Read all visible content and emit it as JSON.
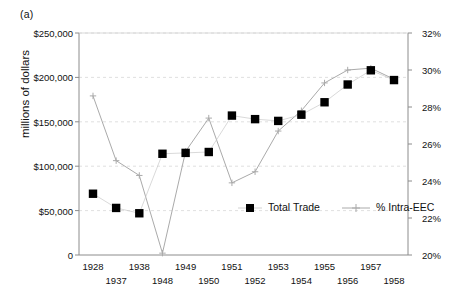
{
  "panel": {
    "label": "(a)"
  },
  "chart_data": {
    "type": "line",
    "title": "",
    "xlabel": "",
    "ylabel": "millions of dollars",
    "y2label": "",
    "grid": true,
    "legend_position": "inside-bottom",
    "x": [
      "1928",
      "1937",
      "1938",
      "1948",
      "1949",
      "1950",
      "1951",
      "1952",
      "1953",
      "1954",
      "1955",
      "1956",
      "1957",
      "1958"
    ],
    "xtick_labels": [
      "1928",
      "1937",
      "1938",
      "1948",
      "1949",
      "1950",
      "1951",
      "1952",
      "1953",
      "1954",
      "1955",
      "1956",
      "1957",
      "1958"
    ],
    "ytick_labels_left": [
      "0",
      "$50,000",
      "$100,000",
      "$150,000",
      "$200,000",
      "$250,000"
    ],
    "ytick_values_left": [
      0,
      50000,
      100000,
      150000,
      200000,
      250000
    ],
    "ylim": [
      0,
      250000
    ],
    "ytick_labels_right": [
      "20%",
      "22%",
      "24%",
      "26%",
      "28%",
      "30%",
      "32%"
    ],
    "ytick_values_right": [
      20,
      22,
      24,
      26,
      28,
      30,
      32
    ],
    "y2lim": [
      20,
      32
    ],
    "series": [
      {
        "name": "Total Trade",
        "axis": "left",
        "marker": "square",
        "color": "#000000",
        "connected": false,
        "values": [
          69000,
          53000,
          47000,
          114000,
          115000,
          116000,
          157000,
          153000,
          151000,
          158000,
          172000,
          192000,
          208000,
          197000
        ]
      },
      {
        "name": "% Intra-EEC",
        "axis": "right",
        "marker": "plus",
        "color": "#aaaaaa",
        "connected": true,
        "values": [
          28.6,
          25.1,
          24.3,
          20.1,
          25.6,
          27.4,
          23.9,
          24.5,
          26.7,
          27.8,
          29.3,
          30.0,
          30.1,
          29.5
        ]
      }
    ],
    "legend": [
      {
        "label": "Total Trade",
        "marker": "square",
        "color": "#000000"
      },
      {
        "label": "% Intra-EEC",
        "marker": "plus",
        "color": "#aaaaaa"
      }
    ]
  }
}
